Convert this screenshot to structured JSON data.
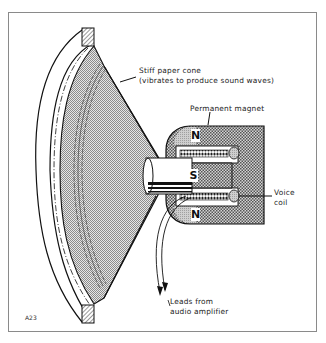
{
  "figure": {
    "id_label": "A23"
  },
  "labels": {
    "cone_line1": "Stiff paper cone",
    "cone_line2": "(vibrates to produce sound waves)",
    "magnet": "Permanent magnet",
    "voice_coil_line1": "Voice",
    "voice_coil_line2": "coil",
    "leads_line1": "Leads from",
    "leads_line2": "audio amplifier"
  },
  "poles": {
    "top": "N",
    "middle": "S",
    "bottom": "N"
  },
  "colors": {
    "ink": "#111111",
    "cone_fill": "#b8b8b8",
    "magnet_fill": "#9a9a9a",
    "frame_border": "#8a8a8a",
    "background": "#ffffff"
  }
}
